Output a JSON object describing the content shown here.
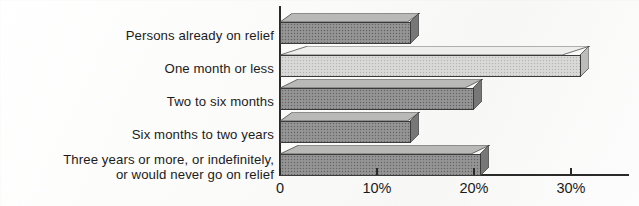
{
  "chart_data": {
    "type": "bar",
    "orientation": "horizontal",
    "title": "",
    "subtitle": "",
    "xlabel": "",
    "ylabel": "",
    "categories": [
      "Persons already on relief",
      "One month or less",
      "Two to six months",
      "Six months to two years",
      "Three years or more, or indefinitely,\nor would never go on relief"
    ],
    "values": [
      13.5,
      31.0,
      20.0,
      13.5,
      20.7
    ],
    "value_unit": "%",
    "xlim": [
      0,
      36
    ],
    "xticks": [
      0,
      10,
      20,
      30
    ],
    "xtick_labels": [
      "0",
      "10%",
      "20%",
      "30%"
    ],
    "grid": false,
    "legend": false,
    "bar_style": "3d-horizontal",
    "bar_colors": [
      "#8f8f8f",
      "#d6d6d4",
      "#8f8f8f",
      "#8f8f8f",
      "#8f8f8f"
    ],
    "bar_shades": [
      "dark",
      "light",
      "dark",
      "dark",
      "dark"
    ],
    "axis_color": "#2a2a2a",
    "text_color": "#1b1b1b",
    "background": "#fdfdfc"
  },
  "bars": [
    {
      "label": "Persons already on relief",
      "value": 13.5,
      "shade": "dark",
      "top": 13,
      "value_text": "13.5%"
    },
    {
      "label": "One month or less",
      "value": 31.0,
      "shade": "light",
      "top": 46,
      "value_text": "31%"
    },
    {
      "label": "Two to six months",
      "value": 20.0,
      "shade": "dark",
      "top": 79,
      "value_text": "20%"
    },
    {
      "label": "Six months to two years",
      "value": 13.5,
      "shade": "dark",
      "top": 112,
      "value_text": "13.5%"
    },
    {
      "label": "Three years or more, or indefinitely,\nor would never go on relief",
      "value": 20.7,
      "shade": "dark",
      "top": 145,
      "value_text": "20.7%"
    }
  ],
  "axis": {
    "ticks": [
      {
        "label": "0",
        "value": 0,
        "x": 280
      },
      {
        "label": "10%",
        "value": 10,
        "x": 377
      },
      {
        "label": "20%",
        "value": 20,
        "x": 474
      },
      {
        "label": "30%",
        "value": 30,
        "x": 571
      }
    ]
  },
  "labels": [
    {
      "text": "Persons already on relief",
      "top": 28
    },
    {
      "text": "One month or less",
      "top": 61
    },
    {
      "text": "Two to six months",
      "top": 94
    },
    {
      "text": "Six months to two years",
      "top": 127
    },
    {
      "text": "Three years or more, or indefinitely,\nor would never go on relief",
      "top": 152
    }
  ]
}
